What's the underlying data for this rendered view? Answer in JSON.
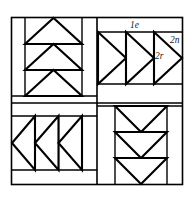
{
  "figure": {
    "kind": "quilt-block-geometric-diagram",
    "title": "",
    "canvas": {
      "width": 192,
      "height": 201
    },
    "colors": {
      "background": "#ffffff",
      "stroke": "#000000",
      "fill": "#ffffff",
      "label_text": "#1a1a1a"
    },
    "outer_frame": {
      "x": 11,
      "y": 17,
      "width": 172,
      "height": 168
    },
    "center_divider": {
      "x": 97,
      "y": 103
    },
    "quadrants": [
      {
        "id": "top-left",
        "name": "three-up-triangles-panel",
        "triangle_direction": "up",
        "triangle_count": 3,
        "strip_side": "left"
      },
      {
        "id": "top-right",
        "name": "three-right-triangles-panel",
        "triangle_direction": "right",
        "triangle_count": 3,
        "strip_side": "top"
      },
      {
        "id": "bottom-left",
        "name": "three-left-triangles-panel",
        "triangle_direction": "left",
        "triangle_count": 3,
        "strip_side": "bottom"
      },
      {
        "id": "bottom-right",
        "name": "three-down-triangles-panel",
        "triangle_direction": "down",
        "triangle_count": 3,
        "strip_side": "right"
      }
    ],
    "labels": [
      {
        "id": "1e",
        "text": "1e",
        "x": 130,
        "y": 21
      },
      {
        "id": "2n",
        "text": "2n",
        "x": 170,
        "y": 36
      },
      {
        "id": "2r",
        "text": "2r",
        "x": 155,
        "y": 52
      }
    ]
  }
}
